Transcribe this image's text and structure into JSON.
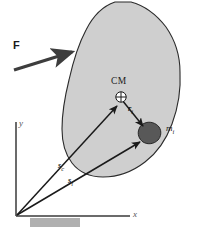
{
  "figure": {
    "colors": {
      "body_fill": "#cfcfcf",
      "body_stroke": "#2b2b2b",
      "particle_fill": "#585858",
      "particle_stroke": "#1c1c1c",
      "vector_stroke": "#1a1a1a",
      "force_stroke": "#3d3d3d",
      "axis_stroke": "#3a3a3a",
      "ground_fill": "#b0b0b0",
      "background": "#ffffff"
    },
    "labels": {
      "force": "F",
      "center_of_mass": "CM",
      "relative_vector": "r",
      "relative_vector_sub": "i",
      "particle_mass": "m",
      "particle_mass_sub": "i",
      "position_cm": "s",
      "position_cm_sub": "c",
      "position_particle": "s",
      "position_particle_sub": "i",
      "axis_x": "x",
      "axis_y": "y"
    },
    "elements": {
      "body_name": "rigid-body-outline",
      "particle_name": "particle-mass-blob",
      "cm_marker_name": "center-of-mass-marker",
      "force_arrow_name": "force-vector-arrow",
      "r_arrow_name": "relative-position-vector-arrow",
      "sc_arrow_name": "cm-position-vector-arrow",
      "si_arrow_name": "particle-position-vector-arrow",
      "ground_name": "ground-block",
      "x_axis_name": "x-axis",
      "y_axis_name": "y-axis"
    }
  }
}
